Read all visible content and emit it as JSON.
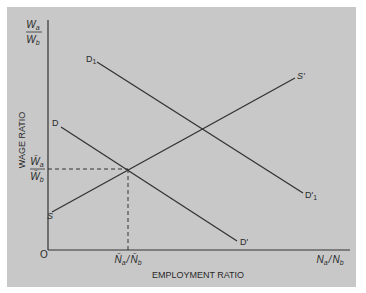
{
  "diagram": {
    "y_axis": {
      "label": "WAGE RATIO",
      "top_label_num": "W",
      "top_label_num_sub": "a",
      "top_label_den": "W",
      "top_label_den_sub": "b",
      "eq_label_num": "W̄",
      "eq_label_num_sub": "a",
      "eq_label_den": "W̄",
      "eq_label_den_sub": "b"
    },
    "x_axis": {
      "label": "EMPLOYMENT RATIO",
      "end_label": "Nₐ / N_b",
      "end_label_a": "N",
      "end_label_a_sub": "a",
      "end_label_b": "N",
      "end_label_b_sub": "b",
      "eq_label_a": "N̄",
      "eq_label_a_sub": "a",
      "eq_label_b": "N̄",
      "eq_label_b_sub": "b",
      "separator": "/"
    },
    "origin": "O",
    "curves": [
      {
        "name": "supply",
        "start_label": "S",
        "end_label": "S'"
      },
      {
        "name": "demand",
        "start_label": "D",
        "end_label": "D'"
      },
      {
        "name": "demand_shifted",
        "start_label": "D",
        "start_sub": "1",
        "end_label": "D'",
        "end_sub": "1"
      }
    ]
  }
}
